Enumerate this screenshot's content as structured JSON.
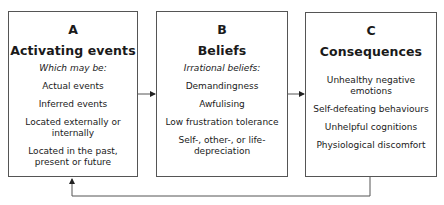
{
  "diagram": {
    "type": "ABC model flow",
    "boxes": [
      {
        "letter": "A",
        "title": "Activating events",
        "subtitle": "Which may be:",
        "items": [
          "Actual events",
          "Inferred events",
          "Located externally or internally",
          "Located in the past, present or future"
        ]
      },
      {
        "letter": "B",
        "title": "Beliefs",
        "subtitle": "Irrational beliefs:",
        "items": [
          "Demandingness",
          "Awfulising",
          "Low frustration tolerance",
          "Self-, other-, or life-depreciation"
        ]
      },
      {
        "letter": "C",
        "title": "Consequences",
        "subtitle": "",
        "items": [
          "Unhealthy negative emotions",
          "Self-defeating behaviours",
          "Unhelpful cognitions",
          "Physiological discomfort"
        ]
      }
    ],
    "arrows": [
      {
        "from": "A",
        "to": "B"
      },
      {
        "from": "B",
        "to": "C"
      },
      {
        "from": "C",
        "to": "A",
        "route": "feedback loop below boxes"
      }
    ],
    "colors": {
      "line": "#555555",
      "text": "#1a1a1a",
      "background": "#ffffff"
    }
  }
}
